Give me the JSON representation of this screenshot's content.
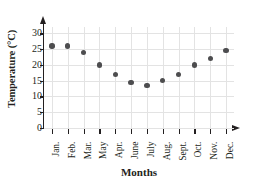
{
  "chart_data": {
    "type": "scatter",
    "title": "",
    "xlabel": "Months",
    "ylabel": "Temperature (°C)",
    "categories": [
      "Jan.",
      "Feb.",
      "Mar.",
      "May",
      "Apr.",
      "June",
      "July",
      "Aug.",
      "Sept.",
      "Oct.",
      "Nov.",
      "Dec."
    ],
    "values": [
      26,
      26,
      24,
      20,
      17,
      14.5,
      13.5,
      15,
      17,
      20,
      22,
      24.5
    ],
    "ylim": [
      0,
      32
    ],
    "yticks": [
      0,
      5,
      10,
      15,
      20,
      25,
      30
    ],
    "ytick_labels": [
      "0",
      "5",
      "10",
      "15",
      "20",
      "25",
      "30"
    ],
    "grid": true,
    "legend": false,
    "marker_color": "#4d4d4f",
    "axis_color": "#231f20",
    "grid_color": "#e3e3e3"
  }
}
